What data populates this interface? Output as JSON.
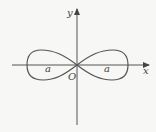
{
  "diagram": {
    "type": "lemniscate",
    "axes": {
      "x_label": "x",
      "y_label": "y",
      "origin_label": "O"
    },
    "curve": {
      "name": "lemniscate of Bernoulli",
      "parameter_labels": [
        "a",
        "a"
      ]
    },
    "colors": {
      "background": "#f7f7f5",
      "stroke": "#555555"
    }
  }
}
